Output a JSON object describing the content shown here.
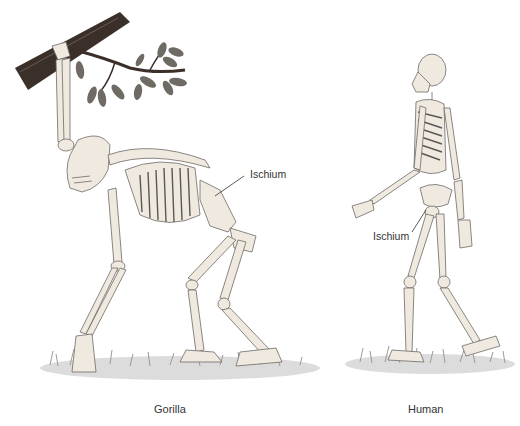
{
  "figure": {
    "panels": [
      {
        "id": "gorilla",
        "caption": "Gorilla",
        "labels": [
          {
            "text": "Ischium"
          }
        ],
        "elements": [
          "tree-branch",
          "leaves",
          "skeleton-quadrupedal",
          "grass"
        ]
      },
      {
        "id": "human",
        "caption": "Human",
        "labels": [
          {
            "text": "Ischium"
          }
        ],
        "elements": [
          "skeleton-bipedal-walking",
          "grass"
        ]
      }
    ],
    "colors": {
      "bone": "#efe9e0",
      "outline": "#6d6a66",
      "branch": "#3b2f2a",
      "leaf": "#6f6a64",
      "grass": "#c9c9c9",
      "text": "#333333",
      "background": "#ffffff"
    }
  }
}
